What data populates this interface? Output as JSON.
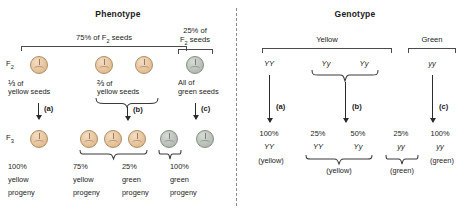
{
  "figure": {
    "panels": {
      "phenotype": {
        "title": "Phenotype",
        "brackets": [
          {
            "label_line1": "75% of F",
            "label_sub": "2",
            "label_line2": " seeds",
            "full": "75% of F2 seeds"
          },
          {
            "label_line1": "25% of",
            "label_line2": "F2 seeds",
            "full": "25% of F2 seeds"
          }
        ],
        "top_bracket_left_label": "75% of F",
        "top_bracket_left_label_sub": "2",
        "top_bracket_left_label_tail": " seeds",
        "top_bracket_right_label_l1": "25% of",
        "top_bracket_right_label_l2": "F",
        "top_bracket_right_label_l2_sub": "2",
        "top_bracket_right_label_l2_tail": " seeds",
        "generation_f2": "F",
        "generation_f2_sub": "2",
        "generation_f3": "F",
        "generation_f3_sub": "3",
        "f2_groups": [
          {
            "id": "group-a",
            "fraction": "⅓",
            "caption_l1": " of",
            "caption_l2": "yellow seeds",
            "seeds": [
              "yellow"
            ],
            "step": "(a)"
          },
          {
            "id": "group-b",
            "fraction": "⅔",
            "caption_l1": " of",
            "caption_l2": "yellow seeds",
            "seeds": [
              "yellow",
              "yellow"
            ],
            "step": "(b)"
          },
          {
            "id": "group-c",
            "fraction": "",
            "caption_l1": "All of",
            "caption_l2": "green seeds",
            "seeds": [
              "green"
            ],
            "step": "(c)"
          }
        ],
        "f3_groups": [
          {
            "id": "f3-a",
            "seeds": [
              "yellow"
            ],
            "pct": "100%",
            "line2": "yellow",
            "line3": "progeny"
          },
          {
            "id": "f3-b1",
            "seeds": [
              "yellow",
              "yellow",
              "yellow"
            ],
            "pct": "75%",
            "line2": "yellow",
            "line3": "progeny"
          },
          {
            "id": "f3-b2",
            "seeds": [
              "green"
            ],
            "pct": "25%",
            "line2": "green",
            "line3": "progeny"
          },
          {
            "id": "f3-c",
            "seeds": [
              "green"
            ],
            "pct": "100%",
            "line2": "green",
            "line3": "progeny"
          }
        ]
      },
      "genotype": {
        "title": "Genotype",
        "groups": [
          {
            "id": "geno-yellow",
            "label": "Yellow"
          },
          {
            "id": "geno-green",
            "label": "Green"
          }
        ],
        "parents": [
          {
            "id": "parent-YY",
            "genotype": "YY"
          },
          {
            "id": "parent-Yy-1",
            "genotype": "Yy"
          },
          {
            "id": "parent-Yy-2",
            "genotype": "Yy"
          },
          {
            "id": "parent-yy",
            "genotype": "yy"
          }
        ],
        "steps": [
          "(a)",
          "(b)",
          "(c)"
        ],
        "offspring": [
          {
            "id": "off-a",
            "pct": "100%",
            "genotype": "YY",
            "pheno": "(yellow)"
          },
          {
            "id": "off-b1",
            "pct": "25%",
            "genotype": "YY",
            "pheno": ""
          },
          {
            "id": "off-b2",
            "pct": "50%",
            "genotype": "Yy",
            "pheno": ""
          },
          {
            "id": "off-b3",
            "pct": "25%",
            "genotype": "yy",
            "pheno": ""
          },
          {
            "id": "off-c",
            "pct": "100%",
            "genotype": "yy",
            "pheno": "(green)"
          }
        ],
        "group_phenos": [
          {
            "id": "pheno-b-yellow",
            "label": "(yellow)"
          },
          {
            "id": "pheno-b-green",
            "label": "(green)"
          }
        ]
      }
    },
    "colors": {
      "yellow_seed": "#e8c59e",
      "green_seed": "#bcc3bb",
      "ink": "#1b1b1b",
      "rule": "#4a4a4a"
    }
  }
}
